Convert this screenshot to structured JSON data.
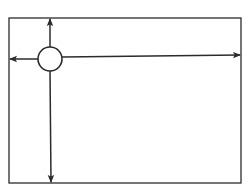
{
  "diagram": {
    "colors": {
      "background": "#ffffff",
      "stroke": "#2b2b2b",
      "node_fill": "#ffffff"
    },
    "frame": {
      "x1": 9,
      "y1": 18,
      "x2": 241,
      "y2": 183
    },
    "node": {
      "cx": 50,
      "cy": 59,
      "r": 12,
      "shape": "circle"
    },
    "arrows": [
      {
        "id": "arrow-up",
        "direction": "up",
        "x1": 50,
        "y1": 47,
        "x2": 50,
        "y2": 19
      },
      {
        "id": "arrow-left",
        "direction": "left",
        "x1": 38,
        "y1": 59,
        "x2": 10,
        "y2": 59
      },
      {
        "id": "arrow-right",
        "direction": "right",
        "x1": 62,
        "y1": 57,
        "x2": 240,
        "y2": 55
      },
      {
        "id": "arrow-down",
        "direction": "down",
        "x1": 50,
        "y1": 71,
        "x2": 51,
        "y2": 182
      }
    ],
    "labels": []
  }
}
